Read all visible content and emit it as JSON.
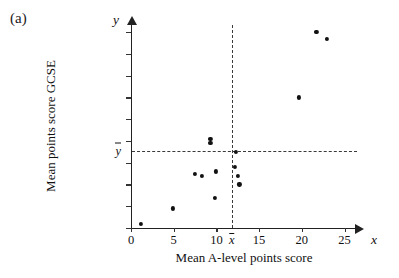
{
  "figure": {
    "part_label": "(a)"
  },
  "chart_data": {
    "type": "scatter",
    "title": "",
    "xlabel": "Mean A-level points score",
    "ylabel": "Mean points score GCSE",
    "x_axis_symbol": "x",
    "y_axis_symbol": "y",
    "xlim": [
      0,
      27
    ],
    "ylim": [
      8,
      104
    ],
    "xticks": [
      0,
      5,
      10,
      15,
      20,
      25
    ],
    "xtick_labels": [
      "0",
      "5",
      "10",
      "15",
      "20",
      "25"
    ],
    "yticks": [
      10,
      20,
      30,
      40,
      50,
      60,
      70,
      80,
      90,
      100
    ],
    "ytick_labels": [
      "10",
      "20",
      "30",
      "40",
      "50",
      "60",
      "70",
      "80",
      "90",
      "100"
    ],
    "grid": false,
    "legend": null,
    "annotations": [
      {
        "name": "x-mean-line",
        "label": "x̄",
        "orientation": "vertical",
        "value": 11.8,
        "style": "dashed"
      },
      {
        "name": "y-mean-line",
        "label": "ȳ",
        "orientation": "horizontal",
        "value": 45.5,
        "style": "dashed"
      }
    ],
    "points": [
      {
        "x": 1.2,
        "y": 12
      },
      {
        "x": 4.9,
        "y": 19
      },
      {
        "x": 7.5,
        "y": 35
      },
      {
        "x": 8.3,
        "y": 34
      },
      {
        "x": 9.3,
        "y": 51
      },
      {
        "x": 9.3,
        "y": 49
      },
      {
        "x": 9.9,
        "y": 36
      },
      {
        "x": 9.8,
        "y": 24
      },
      {
        "x": 12.2,
        "y": 38
      },
      {
        "x": 12.3,
        "y": 45
      },
      {
        "x": 12.5,
        "y": 34
      },
      {
        "x": 12.7,
        "y": 30
      },
      {
        "x": 19.7,
        "y": 70
      },
      {
        "x": 21.7,
        "y": 100
      },
      {
        "x": 22.9,
        "y": 97
      }
    ],
    "marker": {
      "shape": "circle",
      "color": "#111111",
      "size_px": 4.2
    },
    "colors": {
      "axis": "#222222",
      "text": "#111111",
      "mean_line": "#3a3a3a",
      "background": "#ffffff"
    }
  }
}
